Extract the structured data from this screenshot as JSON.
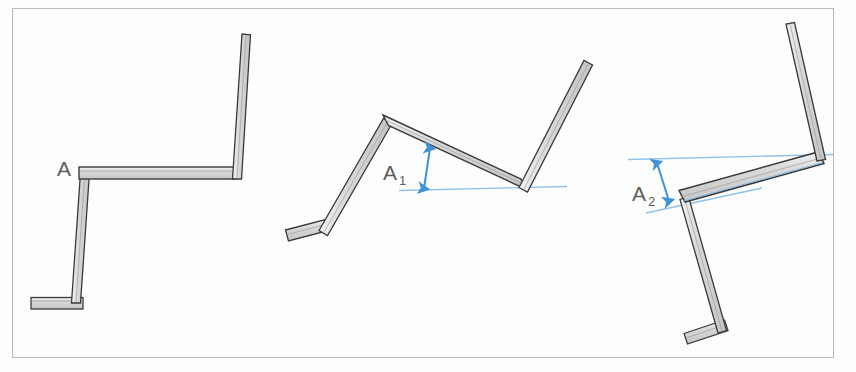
{
  "figure": {
    "frame": {
      "x": 12,
      "y": 8,
      "width": 822,
      "height": 350,
      "border_color": "#b9b9b9",
      "background": "#fdfdfd"
    },
    "page_background": "#ffffff",
    "style": {
      "bar_fill": "#d2d2d2",
      "bar_fill_light": "#e2e2e2",
      "bar_edge": "#3a3a3a",
      "bar_edge_soft": "#6e6e6e",
      "annotation_blue": "#3f93d6",
      "reference_line_blue": "#8fc2e8",
      "label_gray": "#5d5d5d"
    },
    "labels": [
      {
        "id": "label-a",
        "text": "A",
        "subscript": "",
        "x": 58,
        "y": 175
      },
      {
        "id": "label-a1",
        "text": "A",
        "subscript": "1",
        "x": 383,
        "y": 178
      },
      {
        "id": "label-a2",
        "text": "A",
        "subscript": "2",
        "x": 633,
        "y": 199
      }
    ],
    "positions": [
      {
        "id": "position-1",
        "label": "A",
        "description": "Upright rest position: vertical post, horizontal arm, vertical mast, flat base foot",
        "bars": [
          {
            "name": "base-foot",
            "x1": 33,
            "y1": 304,
            "x2": 81,
            "y2": 304,
            "thickness": 11
          },
          {
            "name": "lower-post",
            "x1": 74,
            "y1": 303,
            "x2": 84,
            "y2": 172,
            "thickness": 9
          },
          {
            "name": "horizontal-arm",
            "x1": 82,
            "y1": 174,
            "x2": 233,
            "y2": 174,
            "thickness": 11
          },
          {
            "name": "upper-mast",
            "x1": 234,
            "y1": 176,
            "x2": 245,
            "y2": 35,
            "thickness": 9
          }
        ],
        "annotations": []
      },
      {
        "id": "position-2",
        "label": "A1",
        "description": "First tilted position: arm rotated, reference line horizontal with double arrow showing height A1",
        "bars": [
          {
            "name": "base-foot",
            "x1": 287,
            "y1": 234,
            "x2": 327,
            "y2": 224,
            "thickness": 11
          },
          {
            "name": "lower-post",
            "x1": 323,
            "y1": 227,
            "x2": 388,
            "y2": 122,
            "thickness": 9
          },
          {
            "name": "horizontal-arm",
            "x1": 387,
            "y1": 120,
            "x2": 524,
            "y2": 184,
            "thickness": 12
          },
          {
            "name": "upper-mast",
            "x1": 524,
            "y1": 185,
            "x2": 589,
            "y2": 62,
            "thickness": 9
          }
        ],
        "annotations": [
          {
            "type": "reference-line",
            "name": "reference-line-a1",
            "x1": 400,
            "y1": 190,
            "x2": 566,
            "y2": 186
          },
          {
            "type": "double-arrow",
            "name": "dimension-arrow-a1",
            "x1": 430,
            "y1": 147,
            "x2": 424,
            "y2": 189
          }
        ]
      },
      {
        "id": "position-3",
        "label": "A2",
        "description": "Second tilted position: further rotated, tilted reference line with double arrow showing height A2",
        "bars": [
          {
            "name": "base-foot",
            "x1": 686,
            "y1": 338,
            "x2": 727,
            "y2": 325,
            "thickness": 11
          },
          {
            "name": "lower-post",
            "x1": 722,
            "y1": 331,
            "x2": 684,
            "y2": 198,
            "thickness": 9
          },
          {
            "name": "horizontal-arm",
            "x1": 683,
            "y1": 196,
            "x2": 822,
            "y2": 158,
            "thickness": 13
          },
          {
            "name": "upper-mast",
            "x1": 821,
            "y1": 159,
            "x2": 790,
            "y2": 25,
            "thickness": 9
          }
        ],
        "annotations": [
          {
            "type": "reference-line",
            "name": "reference-line-a2-upper",
            "x1": 629,
            "y1": 159,
            "x2": 832,
            "y2": 154
          },
          {
            "type": "reference-line",
            "name": "reference-line-a2-lower",
            "x1": 648,
            "y1": 212,
            "x2": 760,
            "y2": 188
          },
          {
            "type": "double-arrow",
            "name": "dimension-arrow-a2",
            "x1": 658,
            "y1": 163,
            "x2": 669,
            "y2": 201
          }
        ]
      }
    ]
  }
}
